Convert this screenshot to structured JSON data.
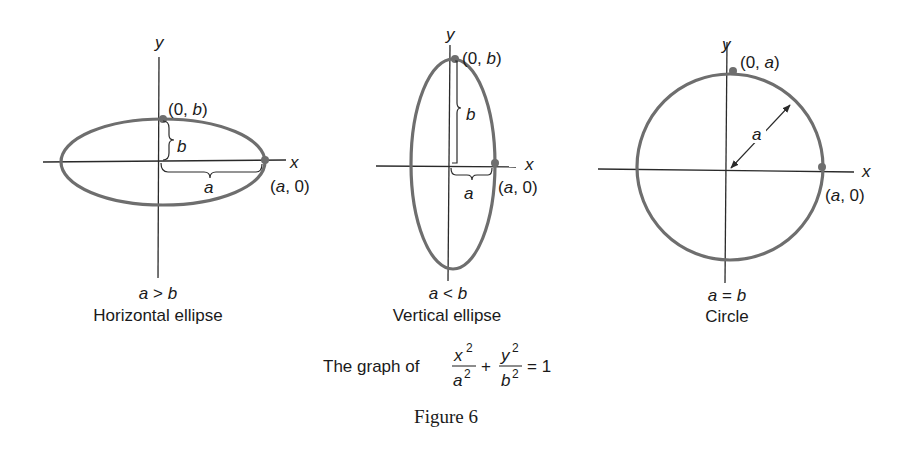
{
  "figure": {
    "caption": "Figure 6",
    "equation": {
      "prefix": "The graph of",
      "term1_num": "x",
      "term1_den": "a",
      "plus": "+",
      "term2_num": "y",
      "term2_den": "b",
      "exp": "2",
      "rhs": "= 1"
    },
    "colors": {
      "curve": "#6e6e6e",
      "axis": "#2a2a2a",
      "text": "#1a1a1a"
    },
    "panels": [
      {
        "id": "horizontal",
        "y_axis_label": "y",
        "x_axis_label": "x",
        "point_top_label": "(0, b)",
        "point_top_label_prefix": "(0, ",
        "point_top_label_var": "b",
        "point_right_label_var": "a",
        "point_right_label_suffix": ", 0)",
        "brace_vertical_label": "b",
        "brace_horizontal_label": "a",
        "condition": "a > b",
        "condition_lhs": "a",
        "condition_op": " > ",
        "condition_rhs": "b",
        "title": "Horizontal ellipse"
      },
      {
        "id": "vertical",
        "y_axis_label": "y",
        "x_axis_label": "x",
        "point_top_label_prefix": "(0, ",
        "point_top_label_var": "b",
        "point_right_label_var": "a",
        "point_right_label_suffix": ", 0)",
        "brace_vertical_label": "b",
        "brace_horizontal_label": "a",
        "condition_lhs": "a",
        "condition_op": " < ",
        "condition_rhs": "b",
        "title": "Vertical ellipse"
      },
      {
        "id": "circle",
        "y_axis_label": "y",
        "x_axis_label": "x",
        "point_top_label_prefix": "(0, ",
        "point_top_label_var": "a",
        "point_right_label_var": "a",
        "point_right_label_suffix": ", 0)",
        "radius_label": "a",
        "condition_lhs": "a",
        "condition_op": " = ",
        "condition_rhs": "b",
        "title": "Circle"
      }
    ]
  }
}
